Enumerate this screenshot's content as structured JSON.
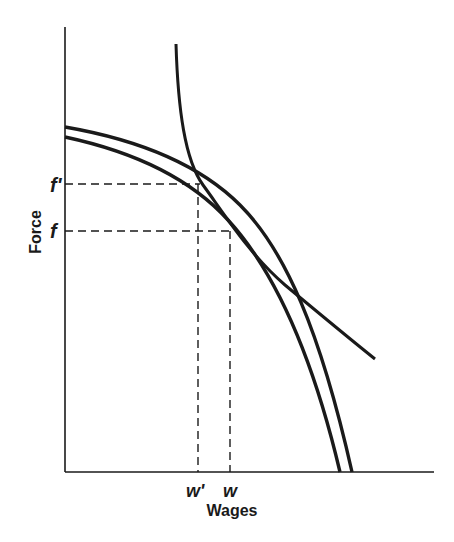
{
  "diagram": {
    "axes": {
      "x_label": "Wages",
      "y_label": "Force"
    },
    "y_ticks": [
      {
        "label": "f'",
        "y": 184
      },
      {
        "label": "f",
        "y": 231
      }
    ],
    "x_ticks": [
      {
        "label": "w'",
        "x": 197
      },
      {
        "label": "w",
        "x": 230
      }
    ],
    "curves": [
      {
        "name": "outer-transformation-curve"
      },
      {
        "name": "inner-transformation-curve"
      },
      {
        "name": "indifference-curve"
      }
    ],
    "colors": {
      "ink": "#1a1a1a",
      "background": "#ffffff"
    }
  }
}
